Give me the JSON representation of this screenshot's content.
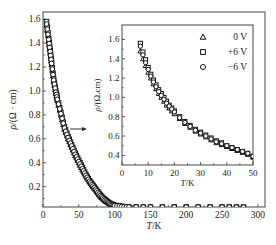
{
  "chart_data": [
    {
      "type": "scatter",
      "title": "",
      "xlabel": "T/K",
      "ylabel": "ρ/(Ω · cm)",
      "xlim": [
        0,
        310
      ],
      "ylim": [
        0.03,
        1.66
      ],
      "xticks": [
        0,
        50,
        100,
        150,
        200,
        250,
        300
      ],
      "yticks": [
        0.2,
        0.4,
        0.6,
        0.8,
        1.0,
        1.2,
        1.4,
        1.6
      ],
      "xtick_labels": [
        "0",
        "50",
        "100",
        "150",
        "200",
        "250",
        "300"
      ],
      "ytick_labels": [
        "0.2",
        "0.4",
        "0.6",
        "0.8",
        "1.0",
        "1.2",
        "1.4",
        "1.6"
      ],
      "grid": false,
      "series": [
        {
          "name": "0 V",
          "marker": "triangle",
          "x": [
            5,
            8,
            10,
            12,
            15,
            18,
            20,
            25,
            30,
            35,
            40,
            45,
            50,
            55,
            60,
            65,
            70,
            75,
            80,
            85,
            90,
            95,
            100,
            110,
            120,
            150,
            200,
            250,
            280
          ],
          "y": [
            1.55,
            1.42,
            1.32,
            1.22,
            1.08,
            0.98,
            0.92,
            0.8,
            0.68,
            0.6,
            0.53,
            0.46,
            0.4,
            0.34,
            0.29,
            0.24,
            0.2,
            0.16,
            0.12,
            0.09,
            0.07,
            0.05,
            0.04,
            0.035,
            0.03,
            0.03,
            0.03,
            0.03,
            0.03
          ]
        },
        {
          "name": "+6 V",
          "marker": "square",
          "x": [
            5,
            8,
            10,
            12,
            15,
            18,
            20,
            25,
            30,
            35,
            40,
            45,
            50,
            55,
            60,
            65,
            70,
            75,
            80,
            85,
            90,
            95,
            100,
            110,
            120,
            150,
            200,
            250,
            280
          ],
          "y": [
            1.58,
            1.44,
            1.34,
            1.24,
            1.1,
            1.0,
            0.94,
            0.82,
            0.7,
            0.62,
            0.55,
            0.48,
            0.42,
            0.36,
            0.3,
            0.25,
            0.21,
            0.17,
            0.13,
            0.1,
            0.075,
            0.055,
            0.045,
            0.035,
            0.03,
            0.03,
            0.03,
            0.03,
            0.03
          ]
        },
        {
          "name": "−6 V",
          "marker": "circle",
          "x": [
            5,
            8,
            10,
            12,
            15,
            18,
            20,
            25,
            30,
            35,
            40,
            45,
            50,
            55,
            60,
            65,
            70,
            75,
            80,
            85,
            90,
            95,
            100,
            110,
            120,
            150,
            200,
            250,
            280
          ],
          "y": [
            1.56,
            1.43,
            1.33,
            1.23,
            1.09,
            0.99,
            0.93,
            0.81,
            0.69,
            0.61,
            0.54,
            0.47,
            0.41,
            0.35,
            0.295,
            0.245,
            0.205,
            0.165,
            0.125,
            0.095,
            0.072,
            0.052,
            0.042,
            0.035,
            0.03,
            0.03,
            0.03,
            0.03,
            0.03
          ]
        }
      ],
      "annotations": [
        "arrow pointing to inset"
      ]
    },
    {
      "type": "scatter",
      "title": "inset",
      "xlabel": "T/K",
      "ylabel": "ρ/(Ω.cm)",
      "xlim": [
        0,
        50
      ],
      "ylim": [
        0.3,
        1.75
      ],
      "xticks": [
        0,
        10,
        20,
        30,
        40,
        50
      ],
      "yticks": [
        0.4,
        0.6,
        0.8,
        1.0,
        1.2,
        1.4,
        1.6
      ],
      "xtick_labels": [
        "0",
        "10",
        "20",
        "30",
        "40",
        "50"
      ],
      "ytick_labels": [
        "0.4",
        "0.6",
        "0.8",
        "1.0",
        "1.2",
        "1.4",
        "1.6"
      ],
      "legend": {
        "position": "upper right",
        "entries": [
          "0 V",
          "+6 V",
          "−6 V"
        ]
      },
      "grid": false,
      "series": [
        {
          "name": "0 V",
          "marker": "triangle",
          "x": [
            7,
            8,
            9,
            10,
            11,
            12,
            13,
            14,
            15,
            16,
            17,
            18,
            19,
            20,
            22,
            24,
            26,
            28,
            30,
            32,
            34,
            36,
            38,
            40,
            42,
            44,
            46,
            48,
            50
          ],
          "y": [
            1.48,
            1.4,
            1.33,
            1.26,
            1.2,
            1.14,
            1.09,
            1.04,
            1.0,
            0.96,
            0.92,
            0.89,
            0.86,
            0.83,
            0.78,
            0.73,
            0.69,
            0.65,
            0.62,
            0.59,
            0.56,
            0.53,
            0.51,
            0.49,
            0.47,
            0.45,
            0.43,
            0.41,
            0.38
          ]
        },
        {
          "name": "+6 V",
          "marker": "square",
          "x": [
            7,
            8,
            9,
            10,
            11,
            12,
            13,
            14,
            15,
            16,
            17,
            18,
            19,
            20,
            22,
            24,
            26,
            28,
            30,
            32,
            34,
            36,
            38,
            40,
            42,
            44,
            46,
            48,
            50
          ],
          "y": [
            1.56,
            1.47,
            1.39,
            1.31,
            1.24,
            1.18,
            1.13,
            1.08,
            1.04,
            1.0,
            0.96,
            0.92,
            0.89,
            0.86,
            0.8,
            0.75,
            0.71,
            0.67,
            0.64,
            0.61,
            0.58,
            0.55,
            0.53,
            0.5,
            0.48,
            0.46,
            0.44,
            0.42,
            0.39
          ]
        },
        {
          "name": "−6 V",
          "marker": "circle",
          "x": [
            7,
            8,
            9,
            10,
            11,
            12,
            13,
            14,
            15,
            16,
            17,
            18,
            19,
            20,
            22,
            24,
            26,
            28,
            30,
            32,
            34,
            36,
            38,
            40,
            42,
            44,
            46,
            48,
            50
          ],
          "y": [
            1.53,
            1.44,
            1.36,
            1.29,
            1.22,
            1.16,
            1.11,
            1.06,
            1.02,
            0.98,
            0.94,
            0.91,
            0.88,
            0.85,
            0.79,
            0.74,
            0.7,
            0.66,
            0.63,
            0.6,
            0.57,
            0.54,
            0.52,
            0.5,
            0.48,
            0.46,
            0.44,
            0.42,
            0.39
          ]
        }
      ]
    }
  ],
  "labels": {
    "main_xlabel": "T/K",
    "main_ylabel": "ρ/(Ω · cm)",
    "inset_xlabel": "T/K",
    "inset_ylabel": "ρ/(Ω.cm)",
    "legend": [
      "0 V",
      "+6 V",
      "−6 V"
    ]
  }
}
